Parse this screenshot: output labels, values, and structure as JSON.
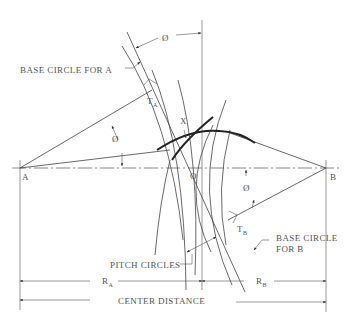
{
  "diagram": {
    "labels": {
      "base_circle_a": "BASE CIRCLE FOR A",
      "base_circle_b_line1": "BASE CIRCLE",
      "base_circle_b_line2": "FOR B",
      "pitch_circles": "PITCH CIRCLES",
      "center_distance": "CENTER DISTANCE",
      "point_a": "A",
      "point_b": "B",
      "point_o": "O",
      "point_x": "X",
      "t_a": "T",
      "t_a_sub": "A",
      "t_b": "T",
      "t_b_sub": "B",
      "r_a": "R",
      "r_a_sub": "A",
      "r_b": "R",
      "r_b_sub": "B",
      "phi_top": "Ø",
      "phi_a": "Ø",
      "phi_b": "Ø"
    }
  }
}
